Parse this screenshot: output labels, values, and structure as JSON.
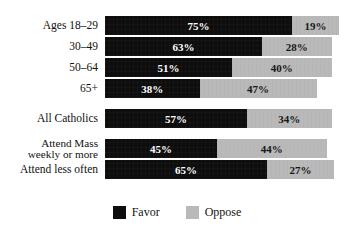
{
  "chart": {
    "title": "",
    "title_visible": false
  },
  "legend": {
    "position": "bottom-center",
    "items": [
      {
        "label": "Favor",
        "color": "#0d0d0d",
        "swatch_name": "legend-swatch-favor"
      },
      {
        "label": "Oppose",
        "color": "#b9b9b9",
        "swatch_name": "legend-swatch-oppose"
      }
    ]
  },
  "chart_data": {
    "type": "bar",
    "orientation": "horizontal",
    "stacked": true,
    "title": "",
    "xlabel": "",
    "ylabel": "",
    "xlim": [
      0,
      100
    ],
    "grid": false,
    "value_suffix": "%",
    "categories": [
      "Ages 18–29",
      "30–49",
      "50–64",
      "65+",
      "All Catholics",
      "Attend Mass\nweekly or more",
      "Attend less often"
    ],
    "series": [
      {
        "name": "Favor",
        "color": "#0d0d0d",
        "values": [
          75,
          63,
          51,
          38,
          57,
          45,
          65
        ]
      },
      {
        "name": "Oppose",
        "color": "#b9b9b9",
        "values": [
          19,
          28,
          40,
          47,
          34,
          44,
          27
        ]
      }
    ],
    "rows": [
      {
        "label": "Ages 18–29",
        "favor": 75,
        "oppose": 19,
        "favor_text": "75%",
        "oppose_text": "19%",
        "group_end": false,
        "two_line": false
      },
      {
        "label": "30–49",
        "favor": 63,
        "oppose": 28,
        "favor_text": "63%",
        "oppose_text": "28%",
        "group_end": false,
        "two_line": false
      },
      {
        "label": "50–64",
        "favor": 51,
        "oppose": 40,
        "favor_text": "51%",
        "oppose_text": "40%",
        "group_end": false,
        "two_line": false
      },
      {
        "label": "65+",
        "favor": 38,
        "oppose": 47,
        "favor_text": "38%",
        "oppose_text": "47%",
        "group_end": true,
        "two_line": false
      },
      {
        "label": "All Catholics",
        "favor": 57,
        "oppose": 34,
        "favor_text": "57%",
        "oppose_text": "34%",
        "group_end": true,
        "two_line": false
      },
      {
        "label": "Attend Mass\nweekly or more",
        "favor": 45,
        "oppose": 44,
        "favor_text": "45%",
        "oppose_text": "44%",
        "group_end": false,
        "two_line": true
      },
      {
        "label": "Attend less often",
        "favor": 65,
        "oppose": 27,
        "favor_text": "65%",
        "oppose_text": "27%",
        "group_end": false,
        "two_line": false
      }
    ]
  }
}
